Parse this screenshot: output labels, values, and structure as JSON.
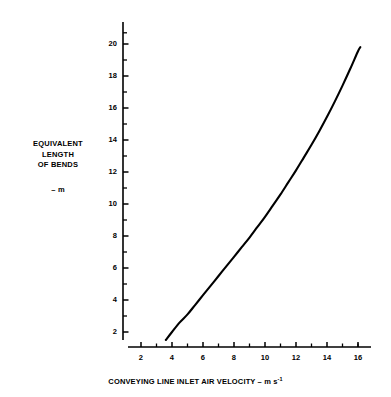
{
  "chart_data": {
    "type": "line",
    "title": "",
    "xlabel": "CONVEYING LINE INLET AIR VELOCITY – m s",
    "xlabel_exponent": "-1",
    "ylabel_lines": "EQUIVALENT\nLENGTH\nOF BENDS",
    "ylabel_unit": "– m",
    "xlim": [
      1.2,
      16.8
    ],
    "ylim": [
      1.2,
      20.9
    ],
    "xticks_major": [
      2,
      4,
      6,
      8,
      10,
      12,
      14,
      16
    ],
    "xticks_major_labels": [
      "2",
      "4",
      "6",
      "8",
      "10",
      "12",
      "14",
      "16"
    ],
    "xticks_minor": [
      3,
      5,
      7,
      9,
      11,
      13,
      15,
      16
    ],
    "yticks_major": [
      2,
      4,
      6,
      8,
      10,
      12,
      14,
      16,
      18,
      20
    ],
    "yticks_major_labels": [
      "2",
      "4",
      "6",
      "8",
      "10",
      "12",
      "14",
      "16",
      "18",
      "20"
    ],
    "yticks_minor": [
      3,
      5,
      7,
      9,
      11,
      13,
      15,
      17,
      19,
      20.7
    ],
    "grid": false,
    "legend": false,
    "line_color": "#000000",
    "background_color": "#ffffff",
    "series": [
      {
        "name": "equivalent length of bends",
        "x": [
          3.6,
          4.0,
          4.5,
          5.0,
          5.5,
          6.0,
          6.5,
          7.0,
          7.5,
          8.0,
          8.5,
          9.0,
          9.5,
          10.0,
          10.5,
          11.0,
          11.5,
          12.0,
          12.5,
          13.0,
          13.5,
          14.0,
          14.5,
          15.0,
          15.5,
          16.0,
          16.15
        ],
        "y": [
          1.5,
          2.0,
          2.6,
          3.1,
          3.7,
          4.3,
          4.9,
          5.5,
          6.1,
          6.7,
          7.3,
          7.9,
          8.55,
          9.2,
          9.9,
          10.6,
          11.35,
          12.1,
          12.9,
          13.7,
          14.55,
          15.45,
          16.4,
          17.4,
          18.45,
          19.55,
          19.8
        ]
      }
    ]
  }
}
